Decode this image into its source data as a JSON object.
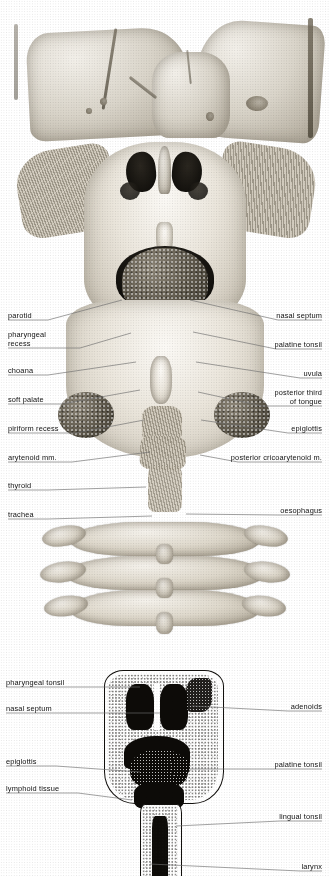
{
  "plate": {
    "title": "Pharynx — posterior view and median section",
    "width": 329,
    "height": 876,
    "background": "#ffffff",
    "ink": "#111111",
    "leader_color": "#6d6d6d"
  },
  "figures": [
    {
      "id": "figure-upper",
      "name": "posterior-pharynx-opened",
      "description": "Halftone engraving: skull base above, pharynx opened from behind, cervical vertebrae below",
      "region": {
        "x": 0,
        "y": 0,
        "width": 329,
        "height": 640
      }
    },
    {
      "id": "figure-lower",
      "name": "median-section-line-drawing",
      "description": "Stippled line drawing of median section through nasal cavity, pharynx and larynx",
      "region": {
        "x": 0,
        "y": 640,
        "width": 329,
        "height": 236
      }
    }
  ],
  "upper_labels_left": [
    {
      "text": "parotid",
      "x": 8,
      "y": 311,
      "line_from_x": 48,
      "line_from_y": 320,
      "line_to_x": 122,
      "line_to_y": 300
    },
    {
      "text": "pharyngeal\nrecess",
      "x": 8,
      "y": 330,
      "line_from_x": 80,
      "line_from_y": 348,
      "line_to_x": 131,
      "line_to_y": 333
    },
    {
      "text": "choana",
      "x": 8,
      "y": 366,
      "line_from_x": 48,
      "line_from_y": 375,
      "line_to_x": 136,
      "line_to_y": 362
    },
    {
      "text": "soft palate",
      "x": 8,
      "y": 395,
      "line_from_x": 62,
      "line_from_y": 404,
      "line_to_x": 140,
      "line_to_y": 390
    },
    {
      "text": "piriform recess",
      "x": 8,
      "y": 424,
      "line_from_x": 76,
      "line_from_y": 433,
      "line_to_x": 144,
      "line_to_y": 420
    },
    {
      "text": "arytenoid mm.",
      "x": 8,
      "y": 453,
      "line_from_x": 72,
      "line_from_y": 462,
      "line_to_x": 150,
      "line_to_y": 452
    },
    {
      "text": "thyroid",
      "x": 8,
      "y": 481,
      "line_from_x": 48,
      "line_from_y": 490,
      "line_to_x": 146,
      "line_to_y": 487
    },
    {
      "text": "trachea",
      "x": 8,
      "y": 510,
      "line_from_x": 48,
      "line_from_y": 519,
      "line_to_x": 152,
      "line_to_y": 516
    }
  ],
  "upper_labels_right": [
    {
      "text": "nasal septum",
      "x": 322,
      "y": 311,
      "line_from_x": 278,
      "line_from_y": 320,
      "line_to_x": 190,
      "line_to_y": 300
    },
    {
      "text": "palatine tonsil",
      "x": 322,
      "y": 340,
      "line_from_x": 276,
      "line_from_y": 349,
      "line_to_x": 193,
      "line_to_y": 332
    },
    {
      "text": "uvula",
      "x": 322,
      "y": 369,
      "line_from_x": 300,
      "line_from_y": 378,
      "line_to_x": 196,
      "line_to_y": 362
    },
    {
      "text": "posterior third\nof tongue",
      "x": 322,
      "y": 388,
      "line_from_x": 262,
      "line_from_y": 406,
      "line_to_x": 198,
      "line_to_y": 392
    },
    {
      "text": "epiglottis",
      "x": 322,
      "y": 424,
      "line_from_x": 288,
      "line_from_y": 433,
      "line_to_x": 201,
      "line_to_y": 420
    },
    {
      "text": "posterior cricoarytenoid m.",
      "x": 322,
      "y": 453,
      "line_from_x": 238,
      "line_from_y": 462,
      "line_to_x": 200,
      "line_to_y": 455
    },
    {
      "text": "oesophagus",
      "x": 322,
      "y": 506,
      "line_from_x": 278,
      "line_from_y": 515,
      "line_to_x": 186,
      "line_to_y": 514
    }
  ],
  "lower_labels_left": [
    {
      "text": "pharyngeal tonsil",
      "x": 6,
      "y": 678,
      "line_from_x": 84,
      "line_from_y": 687,
      "line_to_x": 140,
      "line_to_y": 687
    },
    {
      "text": "nasal septum",
      "x": 6,
      "y": 704,
      "line_from_x": 72,
      "line_from_y": 713,
      "line_to_x": 160,
      "line_to_y": 713
    },
    {
      "text": "epiglottis",
      "x": 6,
      "y": 757,
      "line_from_x": 56,
      "line_from_y": 766,
      "line_to_x": 140,
      "line_to_y": 772
    },
    {
      "text": "lymphoid tissue",
      "x": 6,
      "y": 784,
      "line_from_x": 78,
      "line_from_y": 793,
      "line_to_x": 132,
      "line_to_y": 800
    }
  ],
  "lower_labels_right": [
    {
      "text": "adenoids",
      "x": 322,
      "y": 702,
      "line_from_x": 288,
      "line_from_y": 711,
      "line_to_x": 192,
      "line_to_y": 706
    },
    {
      "text": "palatine tonsil",
      "x": 322,
      "y": 760,
      "line_from_x": 276,
      "line_from_y": 769,
      "line_to_x": 190,
      "line_to_y": 769
    },
    {
      "text": "lingual tonsil",
      "x": 322,
      "y": 812,
      "line_from_x": 280,
      "line_from_y": 821,
      "line_to_x": 176,
      "line_to_y": 826
    },
    {
      "text": "larynx",
      "x": 322,
      "y": 862,
      "line_from_x": 300,
      "line_from_y": 871,
      "line_to_x": 150,
      "line_to_y": 864
    }
  ]
}
